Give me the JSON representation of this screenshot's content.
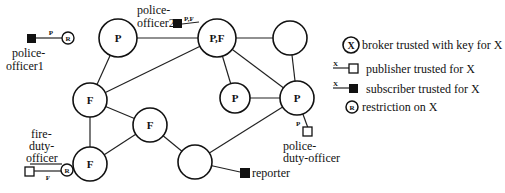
{
  "nodes": [
    {
      "id": "n1",
      "label": "P",
      "x": 118,
      "y": 38
    },
    {
      "id": "n2",
      "label": "P,F",
      "x": 217,
      "y": 38
    },
    {
      "id": "n3",
      "label": "",
      "x": 290,
      "y": 38
    },
    {
      "id": "n4",
      "label": "F",
      "x": 90,
      "y": 100
    },
    {
      "id": "n5",
      "label": "F",
      "x": 150,
      "y": 125
    },
    {
      "id": "n6",
      "label": "P",
      "x": 235,
      "y": 98
    },
    {
      "id": "n7",
      "label": "P",
      "x": 297,
      "y": 98
    },
    {
      "id": "n8",
      "label": "F",
      "x": 90,
      "y": 164
    },
    {
      "id": "n9",
      "label": "",
      "x": 195,
      "y": 162
    }
  ],
  "clients": {
    "police_officer1": {
      "label1": "police-",
      "label2": "officer1",
      "topic": "P",
      "restriction": "R"
    },
    "police_officer2": {
      "label1": "police-",
      "label2": "officer2",
      "topic": "P,F"
    },
    "fire_duty_officer": {
      "label1": "fire-",
      "label2": "duty-",
      "label3": "officer",
      "topic": "F",
      "restriction": "R"
    },
    "police_duty_officer": {
      "label1": "police-",
      "label2": "duty-officer",
      "topic": "P"
    },
    "reporter": {
      "label": "reporter"
    }
  },
  "legend": {
    "broker": {
      "symbol": "X",
      "text": "broker trusted with key for X"
    },
    "publisher": {
      "symbol": "X",
      "text": "publisher trusted for X"
    },
    "subscriber": {
      "symbol": "X",
      "text": "subscriber trusted for X"
    },
    "restriction": {
      "symbol": "R",
      "text": "restriction on X"
    }
  }
}
